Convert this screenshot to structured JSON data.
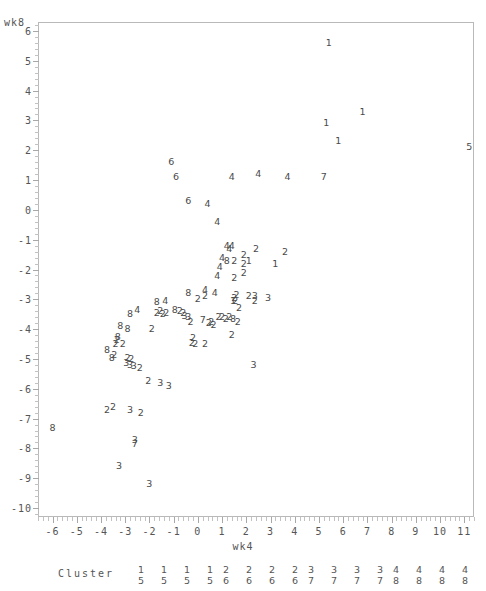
{
  "axes": {
    "y_title": "wk8",
    "x_title": "wk4",
    "y_ticks": [
      "6",
      "5",
      "4",
      "3",
      "2",
      "1",
      "0",
      "-1",
      "-2",
      "-3",
      "-4",
      "-5",
      "-6",
      "-7",
      "-8",
      "-9",
      "-10"
    ],
    "x_ticks": [
      "-6",
      "-5",
      "-4",
      "-3",
      "-2",
      "-1",
      "0",
      "1",
      "2",
      "3",
      "4",
      "5",
      "6",
      "7",
      "8",
      "9",
      "10",
      "11"
    ]
  },
  "legend": {
    "title": "Cluster",
    "keys": [
      {
        "top": "1",
        "bottom": "5"
      },
      {
        "top": "1",
        "bottom": "5"
      },
      {
        "top": "1",
        "bottom": "5"
      },
      {
        "top": "1",
        "bottom": "5"
      },
      {
        "top": "2",
        "bottom": "6"
      },
      {
        "top": "2",
        "bottom": "6"
      },
      {
        "top": "2",
        "bottom": "6"
      },
      {
        "top": "2",
        "bottom": "6"
      },
      {
        "top": "3",
        "bottom": "7"
      },
      {
        "top": "3",
        "bottom": "7"
      },
      {
        "top": "3",
        "bottom": "7"
      },
      {
        "top": "3",
        "bottom": "7"
      },
      {
        "top": "4",
        "bottom": "8"
      },
      {
        "top": "4",
        "bottom": "8"
      },
      {
        "top": "4",
        "bottom": "8"
      },
      {
        "top": "4",
        "bottom": "8"
      }
    ]
  },
  "chart_data": {
    "type": "scatter",
    "title": "",
    "xlabel": "wk4",
    "ylabel": "wk8",
    "xlim": [
      -6.6,
      11.4
    ],
    "ylim": [
      -10.3,
      6.3
    ],
    "grid": false,
    "legend_position": "below-axis",
    "marker_encoding": "digit glyph = cluster id (1-8)",
    "points": [
      {
        "x": 5.4,
        "y": 5.6,
        "label": "1"
      },
      {
        "x": 6.8,
        "y": 3.3,
        "label": "1"
      },
      {
        "x": 5.3,
        "y": 2.9,
        "label": "1"
      },
      {
        "x": 5.8,
        "y": 2.3,
        "label": "1"
      },
      {
        "x": 11.2,
        "y": 2.1,
        "label": "5"
      },
      {
        "x": -1.1,
        "y": 1.6,
        "label": "6"
      },
      {
        "x": -0.9,
        "y": 1.1,
        "label": "6"
      },
      {
        "x": 1.4,
        "y": 1.1,
        "label": "4"
      },
      {
        "x": 2.5,
        "y": 1.2,
        "label": "4"
      },
      {
        "x": 3.7,
        "y": 1.1,
        "label": "4"
      },
      {
        "x": 5.2,
        "y": 1.1,
        "label": "7"
      },
      {
        "x": -0.4,
        "y": 0.3,
        "label": "6"
      },
      {
        "x": 0.4,
        "y": 0.2,
        "label": "4"
      },
      {
        "x": 0.8,
        "y": -0.4,
        "label": "4"
      },
      {
        "x": 1.2,
        "y": -1.2,
        "label": "4"
      },
      {
        "x": 1.4,
        "y": -1.2,
        "label": "4"
      },
      {
        "x": 1.3,
        "y": -1.3,
        "label": "4"
      },
      {
        "x": 2.4,
        "y": -1.3,
        "label": "2"
      },
      {
        "x": 3.6,
        "y": -1.4,
        "label": "2"
      },
      {
        "x": 1.0,
        "y": -1.6,
        "label": "4"
      },
      {
        "x": 1.9,
        "y": -1.5,
        "label": "2"
      },
      {
        "x": 1.9,
        "y": -1.8,
        "label": "2"
      },
      {
        "x": 2.1,
        "y": -1.7,
        "label": "1"
      },
      {
        "x": 3.2,
        "y": -1.8,
        "label": "1"
      },
      {
        "x": 0.9,
        "y": -1.9,
        "label": "4"
      },
      {
        "x": 1.2,
        "y": -1.7,
        "label": "8"
      },
      {
        "x": 1.5,
        "y": -1.7,
        "label": "2"
      },
      {
        "x": 1.9,
        "y": -2.1,
        "label": "2"
      },
      {
        "x": 0.8,
        "y": -2.2,
        "label": "4"
      },
      {
        "x": 1.5,
        "y": -2.3,
        "label": "2"
      },
      {
        "x": 0.3,
        "y": -2.7,
        "label": "4"
      },
      {
        "x": -0.4,
        "y": -2.8,
        "label": "8"
      },
      {
        "x": 0.3,
        "y": -2.9,
        "label": "2"
      },
      {
        "x": 0.7,
        "y": -2.8,
        "label": "4"
      },
      {
        "x": 0.0,
        "y": -3.0,
        "label": "2"
      },
      {
        "x": 1.5,
        "y": -2.95,
        "label": "2"
      },
      {
        "x": 1.6,
        "y": -2.85,
        "label": "2"
      },
      {
        "x": 1.45,
        "y": -3.05,
        "label": "1"
      },
      {
        "x": 1.55,
        "y": -3.05,
        "label": "2"
      },
      {
        "x": 2.1,
        "y": -2.9,
        "label": "2"
      },
      {
        "x": 2.35,
        "y": -2.9,
        "label": "3"
      },
      {
        "x": 2.35,
        "y": -3.05,
        "label": "2"
      },
      {
        "x": 2.9,
        "y": -2.95,
        "label": "3"
      },
      {
        "x": -1.7,
        "y": -3.1,
        "label": "8"
      },
      {
        "x": -1.35,
        "y": -3.05,
        "label": "4"
      },
      {
        "x": -2.8,
        "y": -3.5,
        "label": "8"
      },
      {
        "x": -2.5,
        "y": -3.35,
        "label": "4"
      },
      {
        "x": -1.7,
        "y": -3.45,
        "label": "2"
      },
      {
        "x": -1.55,
        "y": -3.4,
        "label": "2"
      },
      {
        "x": -1.45,
        "y": -3.5,
        "label": "2"
      },
      {
        "x": -1.3,
        "y": -3.45,
        "label": "2"
      },
      {
        "x": -0.95,
        "y": -3.35,
        "label": "8"
      },
      {
        "x": -0.75,
        "y": -3.4,
        "label": "2"
      },
      {
        "x": -0.6,
        "y": -3.45,
        "label": "2"
      },
      {
        "x": -0.55,
        "y": -3.55,
        "label": "3"
      },
      {
        "x": -0.4,
        "y": -3.6,
        "label": "3"
      },
      {
        "x": 1.7,
        "y": -3.3,
        "label": "2"
      },
      {
        "x": -3.2,
        "y": -3.9,
        "label": "8"
      },
      {
        "x": -2.9,
        "y": -4.0,
        "label": "8"
      },
      {
        "x": -1.9,
        "y": -4.0,
        "label": "2"
      },
      {
        "x": -0.3,
        "y": -3.75,
        "label": "2"
      },
      {
        "x": 0.2,
        "y": -3.7,
        "label": "7"
      },
      {
        "x": 0.45,
        "y": -3.8,
        "label": "2"
      },
      {
        "x": 0.55,
        "y": -3.75,
        "label": "2"
      },
      {
        "x": 0.65,
        "y": -3.85,
        "label": "2"
      },
      {
        "x": 0.85,
        "y": -3.6,
        "label": "2"
      },
      {
        "x": 1.0,
        "y": -3.6,
        "label": "2"
      },
      {
        "x": 1.15,
        "y": -3.65,
        "label": "2"
      },
      {
        "x": 1.3,
        "y": -3.6,
        "label": "2"
      },
      {
        "x": 1.45,
        "y": -3.65,
        "label": "8"
      },
      {
        "x": 1.65,
        "y": -3.75,
        "label": "2"
      },
      {
        "x": -3.35,
        "y": -4.35,
        "label": "2"
      },
      {
        "x": -3.3,
        "y": -4.25,
        "label": "8"
      },
      {
        "x": -3.4,
        "y": -4.5,
        "label": "2"
      },
      {
        "x": -3.1,
        "y": -4.5,
        "label": "2"
      },
      {
        "x": -0.2,
        "y": -4.3,
        "label": "2"
      },
      {
        "x": -0.25,
        "y": -4.45,
        "label": "2"
      },
      {
        "x": -0.1,
        "y": -4.5,
        "label": "2"
      },
      {
        "x": 0.3,
        "y": -4.5,
        "label": "2"
      },
      {
        "x": 1.4,
        "y": -4.2,
        "label": "2"
      },
      {
        "x": -3.75,
        "y": -4.7,
        "label": "8"
      },
      {
        "x": -3.55,
        "y": -4.95,
        "label": "8"
      },
      {
        "x": -3.45,
        "y": -4.85,
        "label": "2"
      },
      {
        "x": -2.9,
        "y": -4.95,
        "label": "2"
      },
      {
        "x": -2.75,
        "y": -5.0,
        "label": "2"
      },
      {
        "x": -2.95,
        "y": -5.15,
        "label": "3"
      },
      {
        "x": -2.8,
        "y": -5.2,
        "label": "3"
      },
      {
        "x": -2.65,
        "y": -5.25,
        "label": "3"
      },
      {
        "x": -2.4,
        "y": -5.3,
        "label": "2"
      },
      {
        "x": 2.3,
        "y": -5.2,
        "label": "3"
      },
      {
        "x": -2.05,
        "y": -5.75,
        "label": "2"
      },
      {
        "x": -1.55,
        "y": -5.8,
        "label": "3"
      },
      {
        "x": -1.2,
        "y": -5.9,
        "label": "3"
      },
      {
        "x": -3.75,
        "y": -6.7,
        "label": "2"
      },
      {
        "x": -3.5,
        "y": -6.6,
        "label": "2"
      },
      {
        "x": -2.8,
        "y": -6.7,
        "label": "3"
      },
      {
        "x": -2.35,
        "y": -6.8,
        "label": "2"
      },
      {
        "x": -6.0,
        "y": -7.3,
        "label": "8"
      },
      {
        "x": -2.6,
        "y": -7.7,
        "label": "3"
      },
      {
        "x": -2.6,
        "y": -7.85,
        "label": "7"
      },
      {
        "x": -3.25,
        "y": -8.6,
        "label": "3"
      },
      {
        "x": -2.0,
        "y": -9.2,
        "label": "3"
      }
    ]
  }
}
